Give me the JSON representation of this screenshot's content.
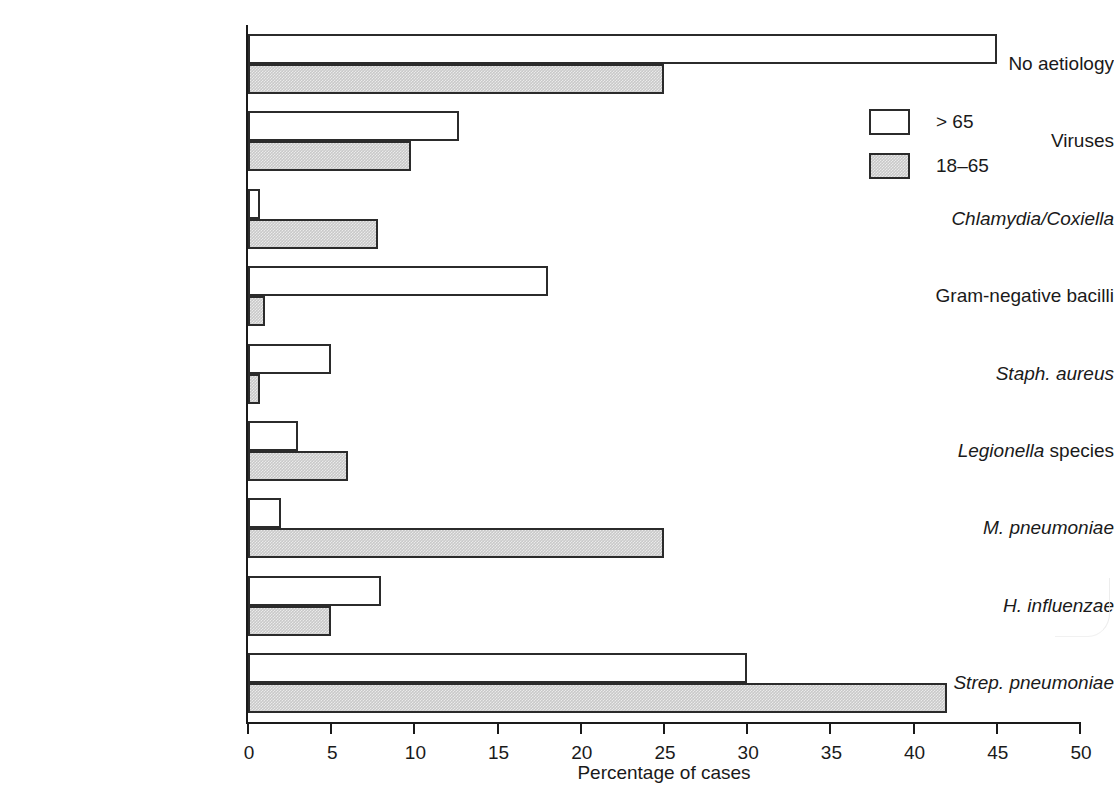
{
  "chart_data": {
    "type": "bar",
    "orientation": "horizontal",
    "title": "",
    "xlabel": "Percentage of cases",
    "ylabel": "",
    "xlim": [
      0,
      50
    ],
    "xticks": [
      0,
      5,
      10,
      15,
      20,
      25,
      30,
      35,
      40,
      45,
      50
    ],
    "grid": false,
    "legend_position": "top-right",
    "categories": [
      "No aetiology",
      "Viruses",
      "Chlamydia/Coxiella",
      "Gram-negative bacilli",
      "Staph. aureus",
      "Legionella species",
      "M. pneumoniae",
      "H. influenzae",
      "Strep. pneumoniae"
    ],
    "series": [
      {
        "name": "> 65",
        "values": [
          45,
          12.7,
          0.7,
          18,
          5,
          3,
          2,
          8,
          30
        ]
      },
      {
        "name": "18–65",
        "values": [
          25,
          9.8,
          7.8,
          1,
          0.7,
          6,
          25,
          5,
          42
        ]
      }
    ],
    "colors": {
      "series_gt65": "#ffffff",
      "series_18_65": "#c9c9c9",
      "outline": "#2b2b2b"
    }
  },
  "axis": {
    "x_title": "Percentage of cases",
    "tick_labels": [
      "0",
      "5",
      "10",
      "15",
      "20",
      "25",
      "30",
      "35",
      "40",
      "45",
      "50"
    ]
  },
  "legend": {
    "entries": [
      {
        "label": "> 65",
        "swatch": "white-swatch"
      },
      {
        "label": "18–65",
        "swatch": "grey-swatch"
      }
    ]
  },
  "categories": [
    {
      "label": "No aetiology",
      "italic_part": "",
      "plain_part": "No aetiology",
      "style": "plain"
    },
    {
      "label": "Viruses",
      "italic_part": "",
      "plain_part": "Viruses",
      "style": "plain"
    },
    {
      "label": "Chlamydia/Coxiella",
      "italic_part": "Chlamydia/Coxiella",
      "plain_part": "",
      "style": "italic"
    },
    {
      "label": "Gram-negative bacilli",
      "italic_part": "",
      "plain_part": "Gram-negative bacilli",
      "style": "plain"
    },
    {
      "label": "Staph. aureus",
      "italic_part": "Staph. aureus",
      "plain_part": "",
      "style": "italic"
    },
    {
      "label": "Legionella species",
      "italic_part": "Legionella",
      "plain_part": " species",
      "style": "mixed"
    },
    {
      "label": "M. pneumoniae",
      "italic_part": "M. pneumoniae",
      "plain_part": "",
      "style": "italic"
    },
    {
      "label": "H. influenzae",
      "italic_part": "H. influenzae",
      "plain_part": "",
      "style": "italic"
    },
    {
      "label": "Strep. pneumoniae",
      "italic_part": "Strep. pneumoniae",
      "plain_part": "",
      "style": "italic"
    }
  ]
}
